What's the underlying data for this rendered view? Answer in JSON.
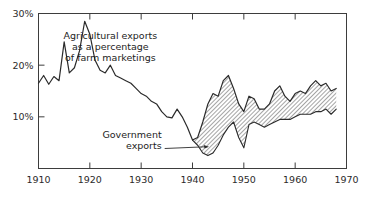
{
  "chart_data": {
    "type": "area",
    "title": "",
    "xlabel": "",
    "ylabel": "",
    "xlim": [
      1910,
      1970
    ],
    "ylim": [
      0,
      30
    ],
    "grid": false,
    "legend_position": "inline-annotation",
    "x_ticks": [
      "1910",
      "1920",
      "1930",
      "1940",
      "1950",
      "1960",
      "1970"
    ],
    "y_ticks": [
      "10%",
      "20%",
      "30%"
    ],
    "y_tick_values": [
      10,
      20,
      30
    ],
    "x_tick_values": [
      1910,
      1920,
      1930,
      1940,
      1950,
      1960,
      1970
    ],
    "annotations": [
      {
        "name": "total-exports-label",
        "lines": [
          "Agricultural exports",
          "as a percentage",
          "of farm marketings"
        ],
        "x": 1924,
        "y": 25
      },
      {
        "name": "government-exports-label",
        "lines": [
          "Government",
          "exports"
        ],
        "x": 1934,
        "y": 6,
        "has_leader_line": true
      }
    ],
    "series": [
      {
        "name": "Agricultural exports as a percentage of farm marketings",
        "style": "line",
        "x": [
          1910,
          1911,
          1912,
          1913,
          1914,
          1915,
          1916,
          1917,
          1918,
          1919,
          1920,
          1921,
          1922,
          1923,
          1924,
          1925,
          1926,
          1927,
          1928,
          1929,
          1930,
          1931,
          1932,
          1933,
          1934,
          1935,
          1936,
          1937,
          1938,
          1939,
          1940,
          1941,
          1942,
          1943,
          1944,
          1945,
          1946,
          1947,
          1948,
          1949,
          1950,
          1951,
          1952,
          1953,
          1954,
          1955,
          1956,
          1957,
          1958,
          1959,
          1960,
          1961,
          1962,
          1963,
          1964,
          1965,
          1966,
          1967,
          1968
        ],
        "values": [
          16.5,
          18.0,
          16.3,
          17.8,
          17.0,
          24.5,
          18.5,
          19.5,
          22.8,
          28.5,
          26.0,
          21.0,
          19.0,
          18.5,
          20.0,
          18.0,
          17.5,
          17.0,
          16.5,
          15.5,
          14.5,
          14.0,
          13.0,
          12.5,
          11.0,
          10.0,
          9.8,
          11.5,
          10.0,
          8.0,
          5.5,
          6.0,
          9.0,
          12.5,
          14.5,
          14.0,
          17.0,
          18.0,
          15.5,
          12.5,
          11.0,
          14.0,
          13.5,
          11.5,
          11.5,
          12.5,
          15.0,
          16.0,
          14.0,
          13.0,
          14.5,
          15.0,
          14.5,
          16.0,
          17.0,
          16.0,
          16.5,
          15.0,
          15.5
        ]
      },
      {
        "name": "Government exports",
        "style": "line-lower-bound",
        "x": [
          1940,
          1941,
          1942,
          1943,
          1944,
          1945,
          1946,
          1947,
          1948,
          1949,
          1950,
          1951,
          1952,
          1953,
          1954,
          1955,
          1956,
          1957,
          1958,
          1959,
          1960,
          1961,
          1962,
          1963,
          1964,
          1965,
          1966,
          1967,
          1968
        ],
        "values": [
          5.5,
          4.5,
          3.0,
          2.5,
          3.0,
          4.5,
          6.5,
          8.0,
          9.0,
          6.0,
          4.0,
          8.5,
          9.0,
          8.5,
          8.0,
          8.5,
          9.0,
          9.5,
          9.5,
          9.5,
          10.0,
          10.5,
          10.5,
          10.5,
          11.0,
          11.0,
          11.5,
          10.5,
          11.5
        ]
      }
    ],
    "band": {
      "name": "government-exports-band",
      "description": "Hatched region between government exports and total agricultural exports",
      "fill": "diagonal-hatch",
      "start_year": 1940,
      "end_year": 1968
    }
  },
  "colors": {
    "background": "#ffffff",
    "line": "#2b2b2b",
    "axis": "#4a4a4a",
    "hatch": "#555555",
    "text": "#1d1d1d"
  }
}
